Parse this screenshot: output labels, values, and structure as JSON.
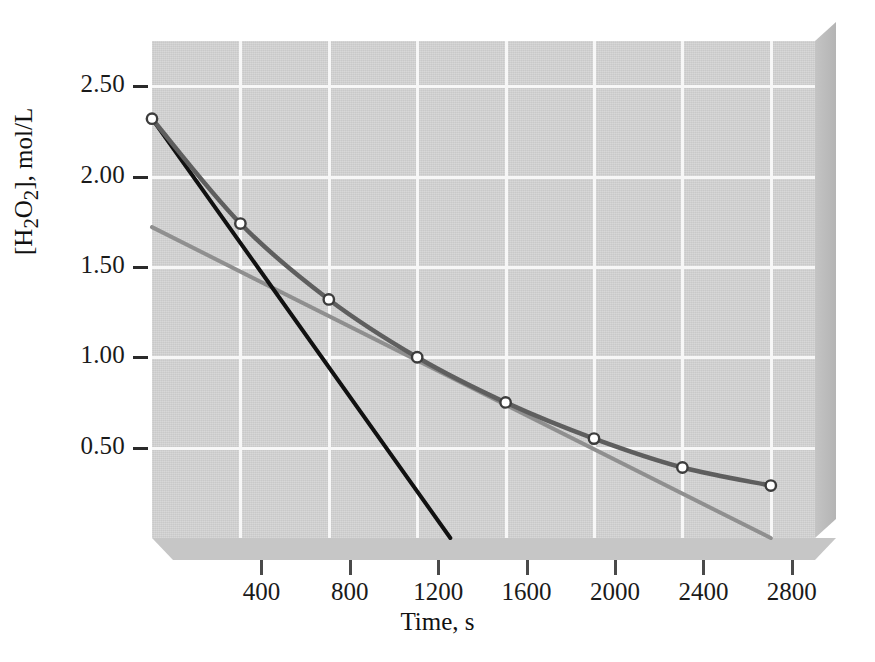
{
  "chart_data": {
    "type": "line",
    "title": "",
    "xlabel": "Time, s",
    "ylabel": "[H2O2], mol/L",
    "ylabel_html": "[H<sub>2</sub>O<sub>2</sub>], mol/L",
    "xlim": [
      0,
      3000
    ],
    "ylim": [
      0.0,
      2.75
    ],
    "grid": true,
    "legend": "none",
    "xticks": [
      400,
      800,
      1200,
      1600,
      2000,
      2400,
      2800
    ],
    "xtick_labels": [
      "400",
      "800",
      "1200",
      "1600",
      "2000",
      "2400",
      "2800"
    ],
    "yticks": [
      0.5,
      1.0,
      1.5,
      2.0,
      2.5
    ],
    "ytick_labels": [
      "0.50",
      "1.00",
      "1.50",
      "2.00",
      "2.50"
    ],
    "series": [
      {
        "name": "concentration-curve",
        "style": "line-with-markers",
        "color": "#5e5e5e",
        "marker": "open-circle",
        "x": [
          0,
          400,
          800,
          1200,
          1600,
          2000,
          2400,
          2800
        ],
        "values": [
          2.32,
          1.74,
          1.32,
          1.0,
          0.75,
          0.55,
          0.39,
          0.29
        ]
      },
      {
        "name": "initial-rate-tangent",
        "style": "straight-line",
        "color": "#111111",
        "marker": "none",
        "x": [
          0,
          1350
        ],
        "values": [
          2.32,
          0.0
        ]
      },
      {
        "name": "average-rate-secant",
        "style": "straight-line",
        "color": "#8f8f8f",
        "marker": "none",
        "x": [
          0,
          2800
        ],
        "values": [
          1.72,
          0.0
        ]
      }
    ]
  },
  "colors": {
    "plot_background": "#c9c9c9",
    "gridline": "#f7f7f7",
    "curve": "#5e5e5e",
    "tangent": "#111111",
    "secant": "#8f8f8f",
    "page_background": "#ffffff"
  }
}
